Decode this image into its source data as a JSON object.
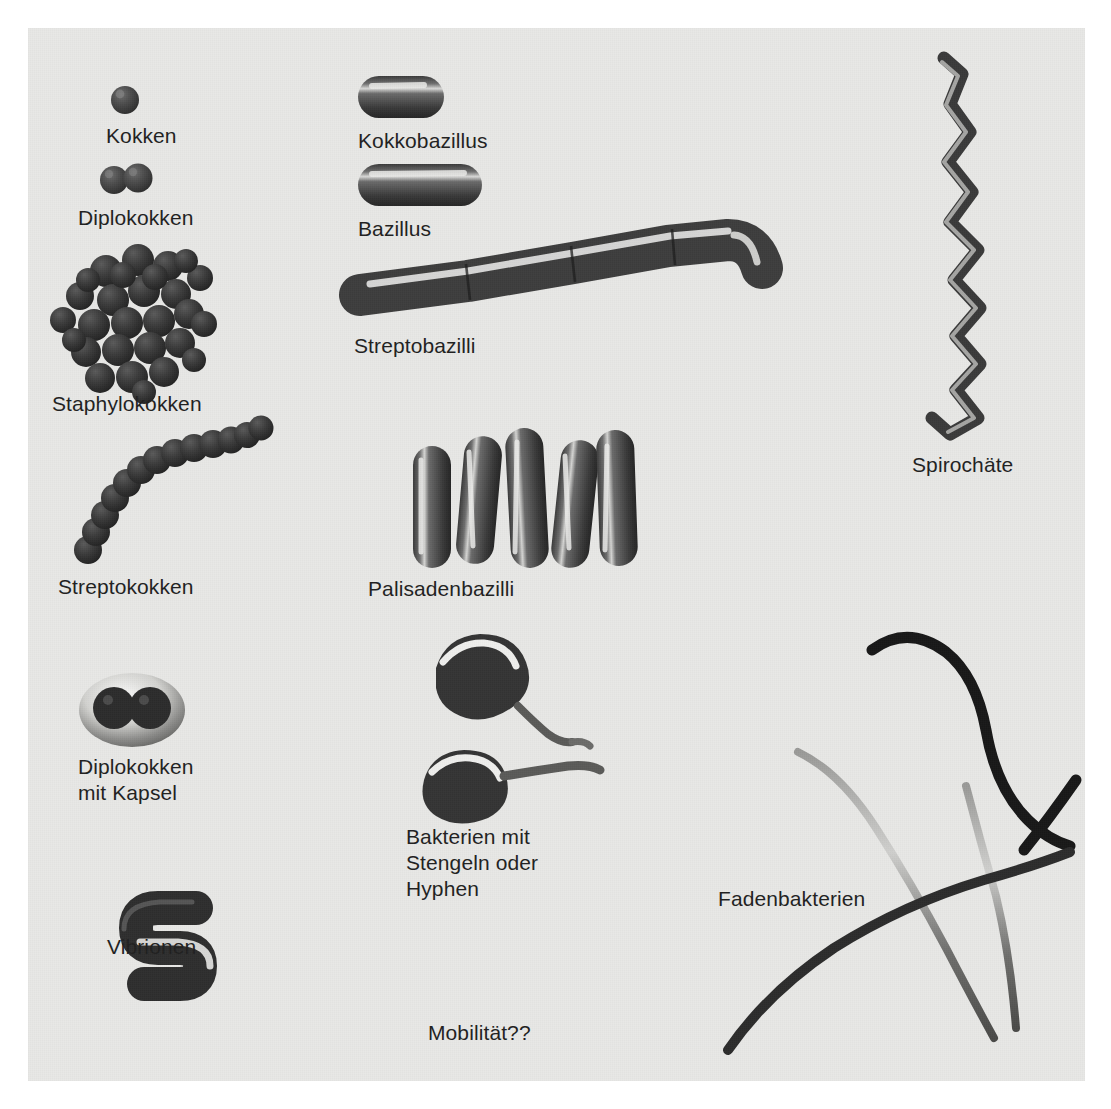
{
  "figure": {
    "background_color": "#e8e8e6",
    "page_color": "#ffffff",
    "text_color": "#1f1f1f",
    "organism_color": "#4a4a4a",
    "organism_shadow_color": "#2b2b2b",
    "organism_highlight_color": "#f2f2f0"
  },
  "columns": {
    "left_label": "Kokken-Formen",
    "middle_label": "Stäbchen-Formen",
    "right_label": "Spiral- und Fadenformen"
  },
  "labels": {
    "kokken": "Kokken",
    "diplokokken": "Diplokokken",
    "staphylokokken": "Staphylokokken",
    "streptokokken": "Streptokokken",
    "diplokokken_mit_kapsel": "Diplokokken\nmit Kapsel",
    "vibrionen": "Vibrionen",
    "kokkobazillus": "Kokkobazillus",
    "bazillus": "Bazillus",
    "streptobazilli": "Streptobazilli",
    "palisadenbazilli": "Palisadenbazilli",
    "bakterien_mit_stengeln": "Bakterien mit\nStengeln oder\nHyphen",
    "mobilitaet": "Mobilität??",
    "spirochaete": "Spirochäte",
    "fadenbakterien": "Fadenbakterien"
  },
  "specimens": [
    {
      "name": "kokken",
      "label": "Kokken",
      "form": "coccus",
      "count": 1,
      "arrangement": "single"
    },
    {
      "name": "diplokokken",
      "label": "Diplokokken",
      "form": "coccus",
      "count": 2,
      "arrangement": "pair"
    },
    {
      "name": "staphylokokken",
      "label": "Staphylokokken",
      "form": "coccus",
      "count": 28,
      "arrangement": "grape-like cluster"
    },
    {
      "name": "streptokokken",
      "label": "Streptokokken",
      "form": "coccus",
      "count": 14,
      "arrangement": "curved chain"
    },
    {
      "name": "diplokokken-mit-kapsel",
      "label": "Diplokokken mit Kapsel",
      "form": "coccus",
      "count": 2,
      "arrangement": "pair inside capsule"
    },
    {
      "name": "vibrionen",
      "label": "Vibrionen",
      "form": "curved rod",
      "count": 1,
      "arrangement": "comma shaped"
    },
    {
      "name": "kokkobazillus",
      "label": "Kokkobazillus",
      "form": "short rod",
      "count": 1,
      "arrangement": "single"
    },
    {
      "name": "bazillus",
      "label": "Bazillus",
      "form": "rod",
      "count": 1,
      "arrangement": "single"
    },
    {
      "name": "streptobazilli",
      "label": "Streptobazilli",
      "form": "rod",
      "count": 5,
      "arrangement": "end-to-end chain"
    },
    {
      "name": "palisadenbazilli",
      "label": "Palisadenbazilli",
      "form": "rod",
      "count": 5,
      "arrangement": "parallel palisade"
    },
    {
      "name": "bakterien-mit-stengeln",
      "label": "Bakterien mit Stengeln oder Hyphen",
      "form": "stalked",
      "count": 2,
      "arrangement": "prosthecate with stalk"
    },
    {
      "name": "spirochaete",
      "label": "Spirochäte",
      "form": "helical filament",
      "count": 1,
      "arrangement": "single coiled"
    },
    {
      "name": "fadenbakterien",
      "label": "Fadenbakterien",
      "form": "filament",
      "count": 4,
      "arrangement": "crossing filaments"
    }
  ],
  "annotations": {
    "motility_question": "Mobilität??"
  }
}
